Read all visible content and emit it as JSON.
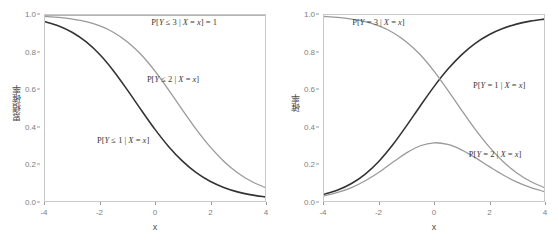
{
  "figure": {
    "panels": [
      {
        "id": "cumulative",
        "name": "cumulative-probability-panel",
        "ylabel": "累積確率",
        "xlabel": "x",
        "xticks": [
          "-4",
          "-2",
          "0",
          "2",
          "4"
        ],
        "yticks": [
          "0.0",
          "0.2",
          "0.4",
          "0.6",
          "0.8",
          "1.0"
        ],
        "annotations": [
          {
            "text": "P[Y ≤ 3 | X = x] = 1",
            "x": 1.05,
            "y": 0.955
          },
          {
            "text": "P[Y ≤ 2 | X = x]",
            "x": 0.65,
            "y": 0.655
          },
          {
            "text": "P[Y ≤ 1 | X = x]",
            "x": -1.15,
            "y": 0.33
          }
        ]
      },
      {
        "id": "individual",
        "name": "probability-panel",
        "ylabel": "確率",
        "xlabel": "x",
        "xticks": [
          "-4",
          "-2",
          "0",
          "2",
          "4"
        ],
        "yticks": [
          "0.0",
          "0.2",
          "0.4",
          "0.6",
          "0.8",
          "1.0"
        ],
        "annotations": [
          {
            "text": "P[Y = 3 | X = x]",
            "x": -2.0,
            "y": 0.955
          },
          {
            "text": "P[Y = 1 | X = x]",
            "x": 2.35,
            "y": 0.625
          },
          {
            "text": "P[Y = 2 | X = x]",
            "x": 2.2,
            "y": 0.255
          }
        ]
      }
    ]
  },
  "colors": {
    "dark_curve": "#333333",
    "light_curve": "#9a9a9a",
    "panel_border": "#c9c9c9",
    "tick_text": "#808080",
    "axis_title": "#4d4d4d",
    "background": "#ffffff"
  },
  "chart_data": {
    "type": "line",
    "title": "",
    "subtitle": "",
    "panels": [
      {
        "name": "累積確率",
        "title": "",
        "xlabel": "x",
        "ylabel": "累積確率",
        "xlim": [
          -4,
          4
        ],
        "ylim": [
          0,
          1
        ],
        "xticks": [
          -4,
          -2,
          0,
          2,
          4
        ],
        "yticks": [
          0.0,
          0.2,
          0.4,
          0.6,
          0.8,
          1.0
        ],
        "grid": false,
        "legend": "annotations-inline",
        "x": [
          -4,
          -3.5,
          -3,
          -2.5,
          -2,
          -1.5,
          -1,
          -0.5,
          0,
          0.5,
          1,
          1.5,
          2,
          2.5,
          3,
          3.5,
          4
        ],
        "series": [
          {
            "name": "P[Y ≤ 1 | X = x]",
            "color": "#333333",
            "formula": "1 / (1 + exp(x - (-0.693)))",
            "values": [
              0.964,
              0.941,
              0.906,
              0.855,
              0.786,
              0.698,
              0.596,
              0.489,
              0.385,
              0.292,
              0.214,
              0.152,
              0.106,
              0.073,
              0.049,
              0.033,
              0.022
            ]
          },
          {
            "name": "P[Y ≤ 2 | X = x]",
            "color": "#9a9a9a",
            "formula": "1 / (1 + exp(x - 0.693))",
            "values": [
              0.992,
              0.987,
              0.978,
              0.964,
              0.941,
              0.906,
              0.855,
              0.786,
              0.698,
              0.596,
              0.489,
              0.385,
              0.292,
              0.214,
              0.152,
              0.106,
              0.073
            ]
          },
          {
            "name": "P[Y ≤ 3 | X = x] = 1",
            "color": "#9a9a9a",
            "formula": "1",
            "values": [
              1,
              1,
              1,
              1,
              1,
              1,
              1,
              1,
              1,
              1,
              1,
              1,
              1,
              1,
              1,
              1,
              1
            ]
          }
        ]
      },
      {
        "name": "確率",
        "title": "",
        "xlabel": "x",
        "ylabel": "確率",
        "xlim": [
          -4,
          4
        ],
        "ylim": [
          0,
          1
        ],
        "xticks": [
          -4,
          -2,
          0,
          2,
          4
        ],
        "yticks": [
          0.0,
          0.2,
          0.4,
          0.6,
          0.8,
          1.0
        ],
        "grid": false,
        "legend": "annotations-inline",
        "x": [
          -4,
          -3.5,
          -3,
          -2.5,
          -2,
          -1.5,
          -1,
          -0.5,
          0,
          0.5,
          1,
          1.5,
          2,
          2.5,
          3,
          3.5,
          4
        ],
        "series": [
          {
            "name": "P[Y = 1 | X = x]",
            "color": "#333333",
            "formula": "1 - 1/(1 + exp(x + 0.693))",
            "values": [
              0.036,
              0.059,
              0.094,
              0.145,
              0.214,
              0.302,
              0.404,
              0.511,
              0.615,
              0.708,
              0.786,
              0.848,
              0.894,
              0.927,
              0.951,
              0.967,
              0.978
            ]
          },
          {
            "name": "P[Y = 2 | X = x]",
            "color": "#9a9a9a",
            "formula": "1/(1 + exp(x - 0.693)) - 1/(1 + exp(x + 0.693))",
            "values": [
              0.028,
              0.046,
              0.072,
              0.109,
              0.155,
              0.208,
              0.259,
              0.297,
              0.313,
              0.304,
              0.275,
              0.233,
              0.186,
              0.141,
              0.103,
              0.073,
              0.051
            ]
          },
          {
            "name": "P[Y = 3 | X = x]",
            "color": "#9a9a9a",
            "formula": "1/(1 + exp(x - 0.693))",
            "values": [
              0.992,
              0.987,
              0.978,
              0.964,
              0.941,
              0.906,
              0.855,
              0.786,
              0.698,
              0.596,
              0.489,
              0.385,
              0.292,
              0.214,
              0.152,
              0.106,
              0.073
            ]
          }
        ],
        "notes": "All three curves intersect near (0, 0.333)."
      }
    ]
  }
}
